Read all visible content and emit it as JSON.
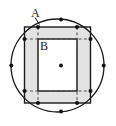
{
  "figure": {
    "name": "circle-octagon-square-diagram",
    "background": "#ffffff",
    "labels": [
      {
        "id": "A",
        "text": "A",
        "x": 31,
        "y": 17,
        "target": "outer-region-between-square-and-circle"
      },
      {
        "id": "B",
        "text": "B",
        "x": 40,
        "y": 50,
        "target": "inner-square-region"
      }
    ],
    "colors": {
      "stroke": "#1a1a1a",
      "shade_fill": "#e3e3e3",
      "inner_fill": "#ffffff",
      "dash": "#4d4d4d",
      "dot": "#111111",
      "circle_stroke": "#1a1a1a"
    },
    "circle": {
      "cx": 57.5,
      "cy": 65.5,
      "r": 46.5,
      "stroke_width": 1.3
    },
    "outer_square": {
      "x": 24.5,
      "y": 27.0,
      "width": 66.0,
      "height": 76.0,
      "stroke_width": 1.4,
      "label": "A"
    },
    "inner_square": {
      "x": 38.0,
      "y": 39.0,
      "width": 39.0,
      "height": 52.0,
      "stroke_width": 1.4,
      "label": "B"
    },
    "center_dot": {
      "cx": 61.0,
      "cy": 65.5,
      "r": 1.9
    },
    "dot_radius": 2.0,
    "vertex_dots": [
      {
        "name": "dot-top-left",
        "cx": 38.0,
        "cy": 27.0
      },
      {
        "name": "dot-top",
        "cx": 61.0,
        "cy": 19.4
      },
      {
        "name": "dot-top-right",
        "cx": 77.0,
        "cy": 27.0
      },
      {
        "name": "dot-right-upper",
        "cx": 90.5,
        "cy": 39.0
      },
      {
        "name": "dot-right",
        "cx": 103.7,
        "cy": 65.5
      },
      {
        "name": "dot-right-lower",
        "cx": 90.5,
        "cy": 91.0
      },
      {
        "name": "dot-bottom-right",
        "cx": 77.0,
        "cy": 103.0
      },
      {
        "name": "dot-bottom",
        "cx": 61.0,
        "cy": 111.6
      },
      {
        "name": "dot-bottom-left",
        "cx": 38.0,
        "cy": 103.0
      },
      {
        "name": "dot-left-lower",
        "cx": 24.5,
        "cy": 91.0
      },
      {
        "name": "dot-left",
        "cx": 11.3,
        "cy": 65.5
      },
      {
        "name": "dot-left-upper",
        "cx": 24.5,
        "cy": 39.0
      }
    ],
    "dashed_lines": [
      {
        "name": "dash-top-horizontal",
        "x1": 24.5,
        "y1": 39.0,
        "x2": 90.5,
        "y2": 39.0
      },
      {
        "name": "dash-bottom-horizontal",
        "x1": 24.5,
        "y1": 91.0,
        "x2": 90.5,
        "y2": 91.0
      },
      {
        "name": "dash-left-vertical",
        "x1": 38.0,
        "y1": 27.0,
        "x2": 38.0,
        "y2": 103.0
      },
      {
        "name": "dash-right-vertical",
        "x1": 77.0,
        "y1": 27.0,
        "x2": 77.0,
        "y2": 103.0
      }
    ],
    "leader_line": {
      "name": "label-a-leader",
      "x1": 35.0,
      "y1": 17.5,
      "x2": 39.5,
      "y2": 24.5
    }
  }
}
